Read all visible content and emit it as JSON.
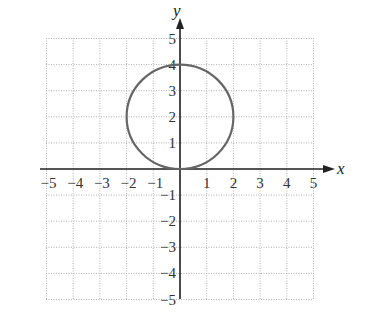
{
  "chart_data": {
    "type": "line",
    "title": "",
    "xlabel": "x",
    "ylabel": "y",
    "xlim": [
      -5,
      5
    ],
    "ylim": [
      -5,
      5
    ],
    "grid": true,
    "grid_style": "dotted",
    "x_ticks": [
      -5,
      -4,
      -3,
      -2,
      -1,
      1,
      2,
      3,
      4,
      5
    ],
    "y_ticks": [
      -5,
      -4,
      -3,
      -2,
      -1,
      1,
      2,
      3,
      4,
      5
    ],
    "series": [
      {
        "name": "circle",
        "shape": "circle",
        "center": [
          0,
          2
        ],
        "radius": 2,
        "equation": "x^2 + (y-2)^2 = 4",
        "color": "#666666"
      }
    ]
  },
  "colors": {
    "grid": "#b0b0b0",
    "axis": "#222222",
    "curve": "#666666"
  }
}
